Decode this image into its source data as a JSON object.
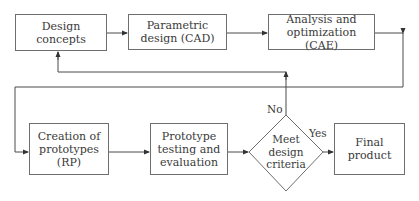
{
  "diagram": {
    "type": "flowchart",
    "nodes": {
      "design_concepts": {
        "line1": "Design",
        "line2": "concepts"
      },
      "parametric_design": {
        "line1": "Parametric",
        "line2": "design (CAD)"
      },
      "analysis_optimization": {
        "line1": "Analysis and",
        "line2": "optimization (CAE)"
      },
      "creation_prototypes": {
        "line1": "Creation of",
        "line2": "prototypes (RP)"
      },
      "prototype_testing": {
        "line1": "Prototype",
        "line2": "testing and",
        "line3": "evaluation"
      },
      "decision": {
        "line1": "Meet",
        "line2": "design",
        "line3": "criteria"
      },
      "final_product": {
        "line1": "Final",
        "line2": "product"
      }
    },
    "edge_labels": {
      "no": "No",
      "yes": "Yes"
    },
    "edges": [
      {
        "from": "Design concepts",
        "to": "Parametric design (CAD)"
      },
      {
        "from": "Parametric design (CAD)",
        "to": "Analysis and optimization (CAE)"
      },
      {
        "from": "Analysis and optimization (CAE)",
        "to": "Creation of prototypes (RP)"
      },
      {
        "from": "Creation of prototypes (RP)",
        "to": "Prototype testing and evaluation"
      },
      {
        "from": "Prototype testing and evaluation",
        "to": "Meet design criteria"
      },
      {
        "from": "Meet design criteria",
        "to": "Final product",
        "label": "Yes"
      },
      {
        "from": "Meet design criteria",
        "to": "Design concepts",
        "label": "No"
      }
    ],
    "colors": {
      "line": "#4a4a4a",
      "border": "#6e6e6e",
      "text": "#3a3a3a"
    }
  }
}
